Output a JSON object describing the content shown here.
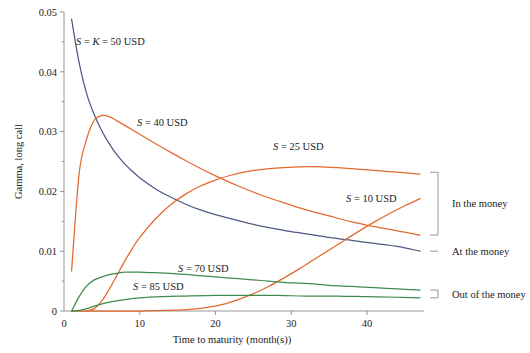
{
  "chart_data": {
    "type": "line",
    "title": "",
    "xlabel": "Time to maturity (month(s))",
    "ylabel": "Gamma, long call",
    "xlim": [
      0,
      47
    ],
    "ylim": [
      0,
      0.05
    ],
    "xticks": [
      0,
      10,
      20,
      30,
      40
    ],
    "xtick_labels": [
      "0",
      "10",
      "20",
      "30",
      "40"
    ],
    "yticks": [
      0,
      0.01,
      0.02,
      0.03,
      0.04,
      0.05
    ],
    "ytick_labels": [
      "0",
      "0.01",
      "0.02",
      "0.03",
      "0.04",
      "0.05"
    ],
    "yminor": [
      0.005,
      0.015,
      0.025,
      0.035,
      0.045
    ],
    "grid": false,
    "legend_position": "inline-annotations",
    "colors": {
      "blue": "#4d5a86",
      "orange": "#e2692e",
      "green": "#3f8a4c",
      "axis": "#8a8a8a",
      "text": "#1a1a1a"
    },
    "series": [
      {
        "name": "S = K = 50 USD",
        "label_prefix": "S",
        "label_mid": "= K =",
        "label_value": "50 USD",
        "color": "#4d5a86",
        "group": "At the money",
        "x": [
          1,
          2,
          3,
          4,
          5,
          6,
          7,
          8,
          9,
          10,
          12,
          14,
          16,
          18,
          20,
          23,
          26,
          29,
          32,
          35,
          38,
          41,
          44,
          47
        ],
        "y": [
          0.0488,
          0.0415,
          0.0363,
          0.0328,
          0.0301,
          0.0279,
          0.0261,
          0.0246,
          0.0234,
          0.0223,
          0.0205,
          0.0191,
          0.0179,
          0.0169,
          0.0161,
          0.0151,
          0.0142,
          0.0135,
          0.0129,
          0.0123,
          0.0118,
          0.0113,
          0.0108,
          0.01
        ]
      },
      {
        "name": "S = 40 USD",
        "label_prefix": "S",
        "label_mid": "=",
        "label_value": "40 USD",
        "color": "#e2692e",
        "group": "In the money",
        "x": [
          1,
          2,
          3,
          4,
          5,
          6,
          7,
          9,
          11,
          13,
          15,
          17,
          20,
          23,
          26,
          29,
          32,
          35,
          38,
          41,
          44,
          47
        ],
        "y": [
          0.0067,
          0.023,
          0.0288,
          0.0319,
          0.0327,
          0.0325,
          0.0318,
          0.0303,
          0.0288,
          0.0273,
          0.0259,
          0.0245,
          0.0226,
          0.0209,
          0.0194,
          0.0181,
          0.0169,
          0.0159,
          0.0149,
          0.0141,
          0.0134,
          0.0127
        ]
      },
      {
        "name": "S = 25 USD",
        "label_prefix": "S",
        "label_mid": "=",
        "label_value": "25 USD",
        "color": "#e2692e",
        "group": "In the money",
        "x": [
          3,
          4,
          5,
          6,
          7,
          8,
          9,
          10,
          12,
          14,
          16,
          18,
          20,
          22,
          25,
          28,
          31,
          34,
          37,
          40,
          43,
          47
        ],
        "y": [
          0.0,
          0.0004,
          0.0017,
          0.0037,
          0.006,
          0.0083,
          0.0104,
          0.0123,
          0.0153,
          0.0177,
          0.0195,
          0.0209,
          0.0219,
          0.0227,
          0.0235,
          0.0239,
          0.0241,
          0.0241,
          0.0239,
          0.0236,
          0.0233,
          0.0229
        ]
      },
      {
        "name": "S = 10 USD",
        "label_prefix": "S",
        "label_mid": "=",
        "label_value": "10 USD",
        "color": "#e2692e",
        "group": "In the money",
        "x": [
          1,
          10,
          14,
          17,
          19,
          21,
          23,
          25,
          27,
          29,
          31,
          33,
          35,
          37,
          39,
          41,
          43,
          45,
          47
        ],
        "y": [
          0.0,
          0.0,
          0.0001,
          0.0003,
          0.0006,
          0.0011,
          0.0019,
          0.0029,
          0.0041,
          0.0055,
          0.007,
          0.0086,
          0.0102,
          0.0118,
          0.0134,
          0.0149,
          0.0163,
          0.0176,
          0.0188
        ]
      },
      {
        "name": "S = 70 USD",
        "label_prefix": "S",
        "label_mid": "=",
        "label_value": "70 USD",
        "color": "#3f8a4c",
        "group": "Out of the money",
        "x": [
          1,
          2,
          3,
          4,
          5,
          6,
          7,
          8,
          9,
          10,
          12,
          14,
          17,
          20,
          23,
          26,
          29,
          32,
          35,
          38,
          41,
          44,
          47
        ],
        "y": [
          0.0,
          0.0024,
          0.0042,
          0.0052,
          0.0057,
          0.0061,
          0.0063,
          0.0065,
          0.0065,
          0.0065,
          0.0064,
          0.0063,
          0.006,
          0.0057,
          0.0054,
          0.0051,
          0.0048,
          0.0046,
          0.0043,
          0.0041,
          0.0039,
          0.0037,
          0.0035
        ]
      },
      {
        "name": "S = 85 USD",
        "label_prefix": "S",
        "label_mid": "=",
        "label_value": "85 USD",
        "color": "#3f8a4c",
        "group": "Out of the money",
        "x": [
          1,
          2,
          3,
          4,
          5,
          6,
          8,
          10,
          13,
          16,
          20,
          24,
          28,
          32,
          36,
          40,
          44,
          47
        ],
        "y": [
          0.0,
          0.0001,
          0.0004,
          0.0008,
          0.0012,
          0.0015,
          0.0019,
          0.0022,
          0.0024,
          0.0025,
          0.0026,
          0.0026,
          0.0026,
          0.0025,
          0.0025,
          0.0024,
          0.0023,
          0.0022
        ]
      }
    ],
    "annotations": [
      {
        "id": "in-the-money",
        "text": "In the money",
        "bracket": true,
        "y_top": 0.0232,
        "y_bottom": 0.0127
      },
      {
        "id": "at-the-money",
        "text": "At the money",
        "bracket": false,
        "y_top": 0.01,
        "y_bottom": 0.01
      },
      {
        "id": "out-of-the-money",
        "text": "Out of the money",
        "bracket": true,
        "y_top": 0.0035,
        "y_bottom": 0.0022
      }
    ]
  }
}
